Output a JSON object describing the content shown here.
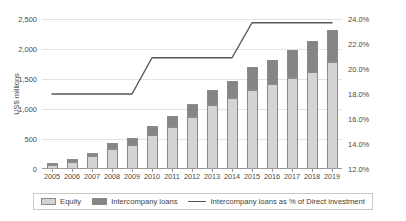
{
  "chart_data": {
    "type": "bar",
    "title": "",
    "subtitle": "",
    "xlabel": "",
    "ylabel": "US$ millions",
    "y2label": "",
    "grid": true,
    "legend_position": "bottom",
    "categories": [
      "2005",
      "2006",
      "2007",
      "2008",
      "2009",
      "2010",
      "2011",
      "2012",
      "2013",
      "2014",
      "2015",
      "2016",
      "2017",
      "2018",
      "2019"
    ],
    "ylim": [
      0,
      2500
    ],
    "y_ticks": [
      "0",
      "500",
      "1,000",
      "1,500",
      "2,000",
      "2,500"
    ],
    "y_tick_values": [
      0,
      500,
      1000,
      1500,
      2000,
      2500
    ],
    "y2lim": [
      12.0,
      24.0
    ],
    "y2_ticks": [
      "12.0%",
      "14.0%",
      "16.0%",
      "18.0%",
      "20.0%",
      "22.0%",
      "24.0%"
    ],
    "y2_tick_values": [
      12.0,
      14.0,
      16.0,
      18.0,
      20.0,
      22.0,
      24.0
    ],
    "series": [
      {
        "name": "Equity",
        "type": "bar-stacked",
        "color": "#d4d4d4",
        "values": [
          60,
          125,
          210,
          330,
          400,
          560,
          700,
          870,
          1060,
          1180,
          1310,
          1420,
          1520,
          1620,
          1780
        ]
      },
      {
        "name": "Intercompany loans",
        "type": "bar-stacked",
        "color": "#858585",
        "values": [
          15,
          35,
          65,
          100,
          120,
          155,
          185,
          210,
          250,
          290,
          390,
          400,
          470,
          510,
          540
        ]
      },
      {
        "name": "Intercompany loans as % of Direct investment",
        "type": "line",
        "color": "#555555",
        "axis": "right",
        "values": [
          18.0,
          18.0,
          18.0,
          18.0,
          18.0,
          20.9,
          20.9,
          20.9,
          20.9,
          20.9,
          23.7,
          23.7,
          23.7,
          23.7,
          23.7
        ]
      }
    ],
    "legend_entries": [
      {
        "label": "Equity",
        "swatch": "equity-swatch"
      },
      {
        "label": "Intercompany loans",
        "swatch": "loans-swatch"
      },
      {
        "label": "Intercompany loans as % of Direct investment",
        "swatch": "line-swatch"
      }
    ],
    "colors": {
      "equity": "#d4d4d4",
      "loans": "#858585",
      "line": "#555555",
      "grid": "#e2e2e2",
      "axis": "#9a9a9a",
      "text": "#4a4a4a"
    }
  }
}
